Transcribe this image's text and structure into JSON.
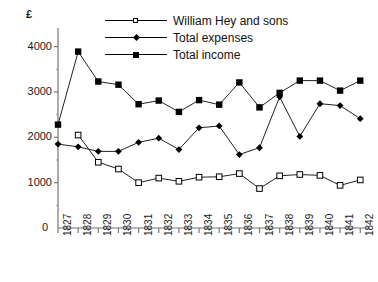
{
  "chart_data": {
    "type": "line",
    "title": "",
    "xlabel": "",
    "ylabel": "£",
    "unit_label": "£",
    "origin_label": "0",
    "categories": [
      "1827",
      "1828",
      "1829",
      "1830",
      "1831",
      "1832",
      "1833",
      "1834",
      "1835",
      "1836",
      "1837",
      "1838",
      "1839",
      "1840",
      "1841",
      "1842"
    ],
    "ytick_labels": [
      "1000",
      "2000",
      "3000",
      "4000"
    ],
    "yticks": [
      1000,
      2000,
      3000,
      4000
    ],
    "ylim": [
      0,
      4300
    ],
    "grid": false,
    "legend_position": "top-center",
    "series": [
      {
        "name": "William Hey and sons",
        "marker": "open-square",
        "values": [
          null,
          2050,
          1450,
          1300,
          1000,
          1100,
          1030,
          1120,
          1130,
          1200,
          870,
          1150,
          1180,
          1160,
          940,
          1060
        ]
      },
      {
        "name": "Total expenses",
        "marker": "filled-diamond",
        "values": [
          1850,
          1790,
          1690,
          1690,
          1890,
          1980,
          1730,
          2210,
          2250,
          1620,
          1770,
          2890,
          2020,
          2740,
          2700,
          2410
        ]
      },
      {
        "name": "Total income",
        "marker": "filled-square",
        "values": [
          2280,
          3890,
          3230,
          3160,
          2730,
          2810,
          2560,
          2820,
          2720,
          3210,
          2660,
          2980,
          3250,
          3250,
          3030,
          3250
        ]
      }
    ]
  },
  "legend": {
    "items": [
      {
        "label": "William Hey and sons"
      },
      {
        "label": "Total expenses"
      },
      {
        "label": "Total income"
      }
    ]
  }
}
